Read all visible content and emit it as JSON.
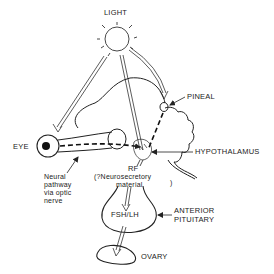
{
  "diagram": {
    "labels": {
      "light": "LIGHT",
      "pineal": "PINEAL",
      "eye": "EYE",
      "hypothalamus": "HYPOTHALAMUS",
      "rf": "RF",
      "neurosecretory_line1": "(?Neurosecretory",
      "neurosecretory_line2": "material",
      "neurosecretory_close": ")",
      "neural_line1": "Neural",
      "neural_line2": "pathway",
      "neural_line3": "via optic",
      "neural_line4": "nerve",
      "fsh_lh": "FSH/LH",
      "anterior_line1": "ANTERIOR",
      "anterior_line2": "PITUITARY",
      "ovary": "OVARY"
    },
    "colors": {
      "ink": "#222222",
      "background": "#ffffff"
    }
  }
}
